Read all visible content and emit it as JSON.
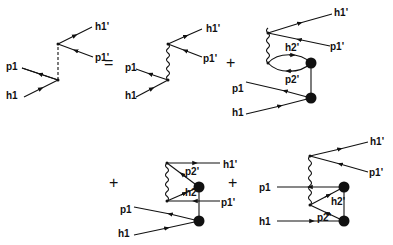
{
  "figure": {
    "type": "feynman-diagram-equation",
    "operators": {
      "equals": "=",
      "plus1": "+",
      "plus2": "+",
      "plus3": "+"
    },
    "diagrams": [
      {
        "id": "lhs",
        "exchange": "dashed",
        "labels": {
          "p1": "p1",
          "h1": "h1",
          "h1p": "h1'",
          "p1p": "p1'"
        }
      },
      {
        "id": "term1",
        "exchange": "wavy",
        "labels": {
          "p1": "p1",
          "h1": "h1",
          "h1p": "h1'",
          "p1p": "p1'"
        }
      },
      {
        "id": "term2",
        "exchange": "wavy+loop",
        "labels": {
          "p1": "p1",
          "h1": "h1",
          "h1p": "h1'",
          "p1p": "p1'",
          "h2p": "h2'",
          "p2p": "p2'"
        }
      },
      {
        "id": "term3",
        "exchange": "wavy+triangle",
        "labels": {
          "p1": "p1",
          "h1": "h1",
          "h1p": "h1'",
          "p1p": "p1'",
          "h2p": "h2'",
          "p2p": "p2'"
        }
      },
      {
        "id": "term4",
        "exchange": "wavy+triangle",
        "labels": {
          "p1": "p1",
          "h1": "h1",
          "h1p": "h1'",
          "p1p": "p1'",
          "h2p": "h2'",
          "p2p": "p2'"
        }
      }
    ]
  }
}
